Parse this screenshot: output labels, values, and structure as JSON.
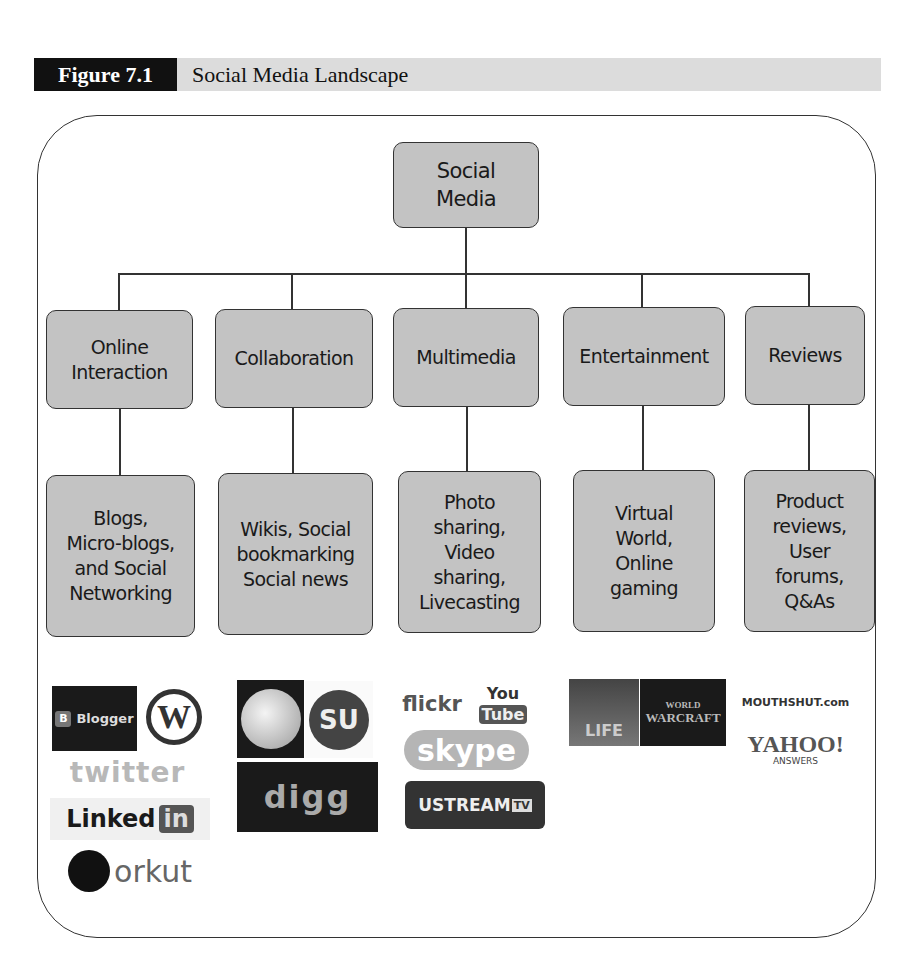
{
  "page_header": {
    "text": "Chapter 7 — Social Media Landscape"
  },
  "figure": {
    "label": "Figure 7.1",
    "title": "Social Media Landscape"
  },
  "diagram": {
    "root": {
      "label": "Social\nMedia"
    },
    "categories": [
      {
        "label": "Online\nInteraction",
        "detail": "Blogs,\nMicro-blogs,\nand Social\nNetworking"
      },
      {
        "label": "Collaboration",
        "detail": "Wikis, Social\nbookmarking\nSocial news"
      },
      {
        "label": "Multimedia",
        "detail": "Photo\nsharing,\nVideo\nsharing,\nLivecasting"
      },
      {
        "label": "Entertainment",
        "detail": "Virtual\nWorld,\nOnline\ngaming"
      },
      {
        "label": "Reviews",
        "detail": "Product\nreviews,\nUser\nforums,\nQ&As"
      }
    ]
  },
  "logos": {
    "online_interaction": [
      "Blogger",
      "W",
      "twitter",
      "Linked",
      "in",
      "orkut"
    ],
    "collaboration": [
      "Wikipedia",
      "SU",
      "digg"
    ],
    "multimedia": [
      "flickr",
      "You",
      "Tube",
      "Broadcast Yourself",
      "skype",
      "USTREAM",
      "TV"
    ],
    "entertainment": [
      "LIFE",
      "WORLD",
      "WARCRAFT"
    ],
    "reviews": [
      "MOUTHSHUT.com",
      "YAHOO!",
      "ANSWERS"
    ]
  }
}
